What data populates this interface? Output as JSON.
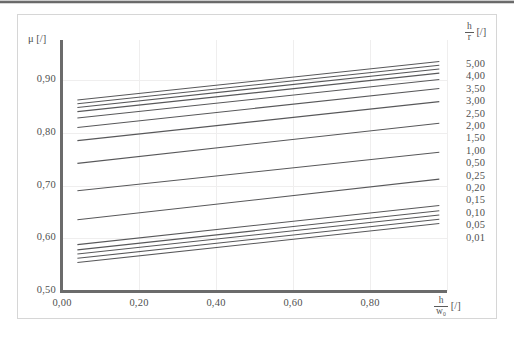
{
  "axes": {
    "y_title": "μ [/]",
    "y_ticks": [
      "0,90",
      "0,80",
      "0,70",
      "0,60",
      "0,50"
    ],
    "x_ticks": [
      "0,00",
      "0,20",
      "0,40",
      "0,60",
      "0,80"
    ],
    "x_title_num": "h",
    "x_title_den": "w₀",
    "x_title_unit": "[/]"
  },
  "legend": {
    "title_num": "h",
    "title_den": "r",
    "title_unit": "[/]",
    "entries": [
      "5,00",
      "4,00",
      "3,50",
      "3,00",
      "2,50",
      "2,00",
      "1,50",
      "1,00",
      "0,50",
      "0,25",
      "0,20",
      "0,15",
      "0,10",
      "0,05",
      "0,01"
    ]
  },
  "colors": {
    "curve": "#58585a",
    "axis": "#6b6b6b",
    "grid": "#efeeee",
    "frame": "#d6d6d6",
    "text": "#4f4f4f"
  },
  "chart_data": {
    "type": "line",
    "title": "",
    "xlabel": "h/w₀ [/]",
    "ylabel": "μ [/]",
    "xlim": [
      0.0,
      1.0
    ],
    "ylim": [
      0.5,
      0.95
    ],
    "x_ticks": [
      0.0,
      0.2,
      0.4,
      0.6,
      0.8
    ],
    "y_ticks": [
      0.5,
      0.6,
      0.7,
      0.8,
      0.9
    ],
    "grid": true,
    "legend_position": "right",
    "legend_title": "h/r [/]",
    "x_start": 0.04,
    "x_end": 0.98,
    "series": [
      {
        "name": "5,00",
        "x": [
          0.04,
          0.98
        ],
        "y": [
          0.862,
          0.935
        ]
      },
      {
        "name": "4,00",
        "x": [
          0.04,
          0.98
        ],
        "y": [
          0.855,
          0.928
        ]
      },
      {
        "name": "3,50",
        "x": [
          0.04,
          0.98
        ],
        "y": [
          0.848,
          0.921
        ]
      },
      {
        "name": "3,00",
        "x": [
          0.04,
          0.98
        ],
        "y": [
          0.84,
          0.913
        ]
      },
      {
        "name": "2,50",
        "x": [
          0.04,
          0.98
        ],
        "y": [
          0.828,
          0.901
        ]
      },
      {
        "name": "2,00",
        "x": [
          0.04,
          0.98
        ],
        "y": [
          0.81,
          0.884
        ]
      },
      {
        "name": "1,50",
        "x": [
          0.04,
          0.98
        ],
        "y": [
          0.785,
          0.859
        ]
      },
      {
        "name": "1,00",
        "x": [
          0.04,
          0.98
        ],
        "y": [
          0.742,
          0.818
        ]
      },
      {
        "name": "0,50",
        "x": [
          0.04,
          0.98
        ],
        "y": [
          0.69,
          0.763
        ]
      },
      {
        "name": "0,25",
        "x": [
          0.04,
          0.98
        ],
        "y": [
          0.635,
          0.712
        ]
      },
      {
        "name": "0,20",
        "x": [
          0.04,
          0.98
        ],
        "y": [
          0.588,
          0.662
        ]
      },
      {
        "name": "0,15",
        "x": [
          0.04,
          0.98
        ],
        "y": [
          0.578,
          0.652
        ]
      },
      {
        "name": "0,10",
        "x": [
          0.04,
          0.98
        ],
        "y": [
          0.57,
          0.644
        ]
      },
      {
        "name": "0,05",
        "x": [
          0.04,
          0.98
        ],
        "y": [
          0.562,
          0.636
        ]
      },
      {
        "name": "0,01",
        "x": [
          0.04,
          0.98
        ],
        "y": [
          0.554,
          0.628
        ]
      }
    ]
  }
}
